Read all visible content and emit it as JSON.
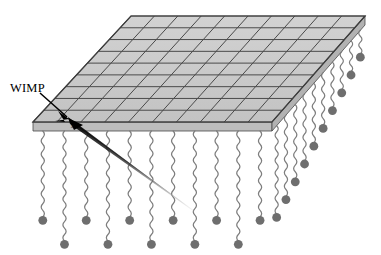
{
  "figure": {
    "background_color": "#ffffff",
    "width": 381,
    "height": 255
  },
  "labels": {
    "wimp": "WIMP",
    "recoil": "x"
  },
  "colors": {
    "panel_fill": "#c9c9c9",
    "panel_fill_light": "#d6d6d6",
    "panel_edge": "#4a4a4a",
    "slab_side_fill": "#bdbdbd",
    "wire": "#7d7d7d",
    "ball": "#6e6e6e",
    "track": "#000000",
    "label_text": "#000000"
  },
  "detector_panel": {
    "name": "detector-grid-plane",
    "description": "Shaded parallelogram slab drawn in oblique projection",
    "corners": {
      "back_left": [
        131,
        16
      ],
      "back_right": [
        365,
        16
      ],
      "front_right": [
        272,
        122
      ],
      "front_left": [
        33,
        122
      ]
    },
    "slab_thickness_px": 9,
    "grid_rows": 9,
    "grid_columns": 10,
    "row_line_color": "#4a4a4a",
    "column_line_color": "#4a4a4a"
  },
  "wimp_track": {
    "name": "wimp-trajectory",
    "description": "Tapered arrow entering the detector plane from upper-left and continuing to lower-right",
    "arrow_tip": [
      68,
      118
    ],
    "tail_end": [
      196,
      212
    ],
    "label_anchor": [
      10,
      90
    ],
    "leader_start": [
      40,
      93
    ],
    "leader_end": [
      66,
      117
    ],
    "head_width_px": 11,
    "taper": "thick at impact point, fading to hairline at tail"
  },
  "sensor_strings": {
    "name": "wavy-sensor-wires",
    "description": "Wavy vertical wires hanging from the slab underside, each terminated by a filled circular mass",
    "wire_width_px": 1.2,
    "ball_radius_px": 4.4,
    "wave_amplitude_px": 3.2,
    "wave_period_px": 13,
    "front_row": {
      "count": 11,
      "note": "hanging below the front edge, alternating long and short lengths"
    },
    "right_row": {
      "count": 10,
      "note": "receding along the right edge toward the back, getting progressively shorter"
    }
  },
  "legend": {
    "items": [
      {
        "key": "wimp",
        "label": "WIMP",
        "meaning": "incoming weakly interacting massive particle"
      }
    ]
  }
}
